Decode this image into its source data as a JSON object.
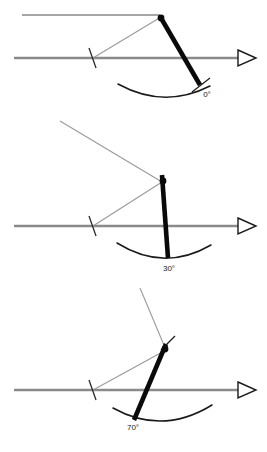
{
  "figure": {
    "background_color": "#ffffff",
    "width": 267,
    "height": 452,
    "panel_count": 3
  },
  "colors": {
    "axis_gray": "#8a8a8a",
    "ray_gray": "#9a9a9a",
    "arm_black": "#0a0a0a",
    "arc_black": "#1a1a1a",
    "label_black": "#1a1a1a",
    "arrow_fill": "#ffffff"
  },
  "panels": [
    {
      "id": "panel-0-degrees",
      "index": 0,
      "angle_label": "0°",
      "angle_value": 0,
      "angle_unit": "degrees",
      "label_x": 207,
      "label_y": 97,
      "axis": {
        "x1": 14,
        "y1": 58,
        "x2": 238,
        "y2": 58
      },
      "arrow": {
        "tip_x": 256,
        "tip_y": 58,
        "back_x": 238,
        "back_y": 50,
        "back2_x": 238,
        "back2_y": 66
      },
      "upper_line": {
        "x1": 22,
        "y1": 15,
        "x2": 160,
        "y2": 15
      },
      "rays": [
        {
          "name": "incident-ray",
          "x1": 93,
          "y1": 58,
          "x2": 161,
          "y2": 17
        }
      ],
      "tick": {
        "x1": 89,
        "y1": 48,
        "x2": 96,
        "y2": 68
      },
      "pivot": {
        "x": 161,
        "y": 18,
        "r": 3.4
      },
      "arm": {
        "x1": 161,
        "y1": 18,
        "x2": 200,
        "y2": 85
      },
      "arm_tip": {
        "x1": 192,
        "y1": 92,
        "x2": 210,
        "y2": 78
      },
      "arc": {
        "start_x": 118,
        "start_y": 84,
        "end_x": 210,
        "end_y": 86,
        "sweep_y": 103
      }
    },
    {
      "id": "panel-30-degrees",
      "index": 1,
      "angle_label": "30°",
      "angle_value": 30,
      "angle_unit": "degrees",
      "label_x": 169,
      "label_y": 271,
      "axis": {
        "x1": 14,
        "y1": 226,
        "x2": 238,
        "y2": 226
      },
      "arrow": {
        "tip_x": 256,
        "tip_y": 226,
        "back_x": 238,
        "back_y": 218,
        "back2_x": 238,
        "back2_y": 234
      },
      "upper_line": null,
      "rays": [
        {
          "name": "incoming-ray",
          "x1": 60,
          "y1": 121,
          "x2": 162,
          "y2": 182
        },
        {
          "name": "reflected-ray",
          "x1": 162,
          "y1": 182,
          "x2": 93,
          "y2": 226
        }
      ],
      "tick": {
        "x1": 89,
        "y1": 216,
        "x2": 96,
        "y2": 236
      },
      "pivot": {
        "x": 163,
        "y": 181,
        "r": 3.4
      },
      "arm": {
        "x1": 162,
        "y1": 175,
        "x2": 168,
        "y2": 258
      },
      "arm_tip": null,
      "arc": {
        "start_x": 117,
        "start_y": 243,
        "end_x": 211,
        "end_y": 245,
        "sweep_y": 265
      }
    },
    {
      "id": "panel-70-degrees",
      "index": 2,
      "angle_label": "70°",
      "angle_value": 70,
      "angle_unit": "degrees",
      "label_x": 133,
      "label_y": 430,
      "axis": {
        "x1": 14,
        "y1": 390,
        "x2": 238,
        "y2": 390
      },
      "arrow": {
        "tip_x": 256,
        "tip_y": 390,
        "back_x": 238,
        "back_y": 382,
        "back2_x": 238,
        "back2_y": 398
      },
      "upper_line": null,
      "rays": [
        {
          "name": "incoming-ray",
          "x1": 140,
          "y1": 288,
          "x2": 166,
          "y2": 350
        },
        {
          "name": "reflected-ray",
          "x1": 166,
          "y1": 350,
          "x2": 93,
          "y2": 390
        }
      ],
      "tick": {
        "x1": 89,
        "y1": 380,
        "x2": 96,
        "y2": 400
      },
      "pivot": {
        "x": 165,
        "y": 349,
        "r": 3.4
      },
      "arm": {
        "x1": 166,
        "y1": 344,
        "x2": 134,
        "y2": 420
      },
      "arm_tip": {
        "x1": 161,
        "y1": 350,
        "x2": 175,
        "y2": 336
      },
      "arc": {
        "start_x": 113,
        "start_y": 408,
        "end_x": 212,
        "end_y": 405,
        "sweep_y": 428
      }
    }
  ]
}
